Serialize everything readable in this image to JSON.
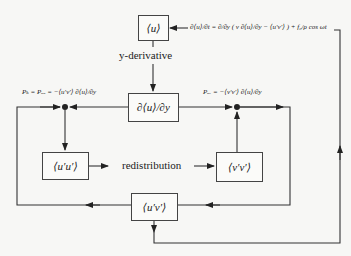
{
  "diagram": {
    "nodes": {
      "mean_velocity": "⟨u⟩",
      "mean_gradient": "∂⟨u⟩/∂y",
      "uu_stress": "⟨u′u′⟩",
      "vv_stress": "⟨v′v′⟩",
      "uv_stress": "⟨u′v′⟩"
    },
    "labels": {
      "y_derivative": "y-derivative",
      "redistribution": "redistribution"
    },
    "equations": {
      "momentum": "∂⟨u⟩/∂t = ∂/∂y ( ν ∂⟨u⟩/∂y − ⟨u′v′⟩ ) + f₀/ρ cos ωt",
      "production_k": "Pₖ = Pᵤᵤ = −⟨u′v′⟩ ∂⟨u⟩/∂y",
      "production_uv": "Pᵤᵥ = −⟨v′v′⟩ ∂⟨u⟩/∂y"
    },
    "edges": [
      {
        "from": "momentum",
        "to": "mean_velocity"
      },
      {
        "from": "mean_velocity",
        "to": "mean_gradient",
        "label": "y-derivative"
      },
      {
        "from": "mean_gradient",
        "to": "production_k"
      },
      {
        "from": "mean_gradient",
        "to": "production_uv"
      },
      {
        "from": "production_k",
        "to": "uu_stress"
      },
      {
        "from": "uu_stress",
        "to": "vv_stress",
        "label": "redistribution"
      },
      {
        "from": "vv_stress",
        "to": "production_uv"
      },
      {
        "from": "production_uv",
        "to": "uv_stress"
      },
      {
        "from": "uv_stress",
        "to": "production_k"
      },
      {
        "from": "uv_stress",
        "to": "momentum"
      }
    ]
  }
}
